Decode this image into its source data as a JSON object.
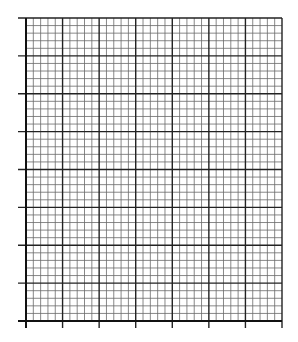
{
  "chart_data": {
    "type": "table",
    "title": "",
    "xlabel": "",
    "ylabel": "",
    "grid": true,
    "x_major_divisions": 7,
    "y_major_divisions": 8,
    "minor_per_major": 5,
    "series": [],
    "plot_area": {
      "left": 26,
      "top": 18,
      "right": 282,
      "bottom": 321
    },
    "colors": {
      "major": "#222222",
      "minor": "#6a6a6a",
      "axis": "#111111",
      "background": "#ffffff"
    }
  }
}
